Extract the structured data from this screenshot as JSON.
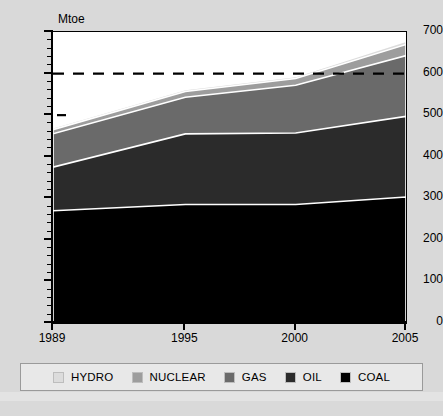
{
  "axis": {
    "unit_label": "Mtoe",
    "y_ticks": [
      "0",
      "100",
      "200",
      "300",
      "400",
      "500",
      "600",
      "700"
    ],
    "x_ticks": [
      "1989",
      "1995",
      "2000",
      "2005"
    ]
  },
  "legend": {
    "items": [
      {
        "label": "HYDRO",
        "color": "#dcdcdc"
      },
      {
        "label": "NUCLEAR",
        "color": "#9d9d9d"
      },
      {
        "label": "GAS",
        "color": "#6a6a6a"
      },
      {
        "label": "OIL",
        "color": "#2b2b2b"
      },
      {
        "label": "COAL",
        "color": "#000000"
      }
    ]
  },
  "reference_line": {
    "value": 600,
    "style": "dashed"
  },
  "chart_data": {
    "type": "area",
    "title": "",
    "subtitle": "",
    "xlabel": "",
    "ylabel": "Mtoe",
    "x": [
      1989,
      1995,
      2000,
      2005
    ],
    "categories": [
      "1989",
      "1995",
      "2000",
      "2005"
    ],
    "ylim": [
      0,
      700
    ],
    "xlim": [
      1989,
      2005
    ],
    "y_tick_step": 100,
    "y_minor_tick_step": 20,
    "grid": false,
    "stacked": true,
    "legend_position": "bottom",
    "annotations": [
      {
        "type": "hline",
        "value": 600,
        "style": "dashed",
        "color": "#000000"
      }
    ],
    "series": [
      {
        "name": "COAL",
        "color": "#000000",
        "values": [
          270,
          285,
          285,
          303
        ]
      },
      {
        "name": "OIL",
        "color": "#2b2b2b",
        "values": [
          105,
          170,
          172,
          194
        ]
      },
      {
        "name": "GAS",
        "color": "#6a6a6a",
        "values": [
          80,
          88,
          115,
          146
        ]
      },
      {
        "name": "NUCLEAR",
        "color": "#9d9d9d",
        "values": [
          10,
          14,
          16,
          27
        ]
      },
      {
        "name": "HYDRO",
        "color": "#dcdcdc",
        "values": [
          5,
          5,
          5,
          8
        ]
      }
    ],
    "cumulative_tops": {
      "COAL": [
        270,
        285,
        285,
        303
      ],
      "OIL": [
        375,
        455,
        457,
        497
      ],
      "GAS": [
        455,
        543,
        572,
        643
      ],
      "NUCLEAR": [
        465,
        557,
        588,
        670
      ],
      "HYDRO": [
        470,
        562,
        593,
        678
      ]
    }
  }
}
